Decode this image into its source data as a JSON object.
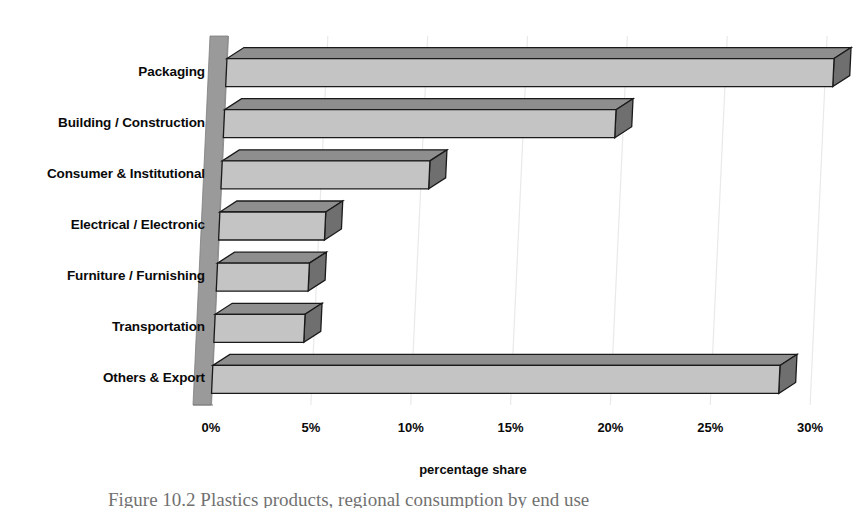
{
  "figure": {
    "caption": "Figure 10.2 Plastics products, regional consumption by end use"
  },
  "chart_data": {
    "type": "bar",
    "orientation": "horizontal",
    "style": "3d-bar",
    "title": "",
    "subtitle": "",
    "xlabel": "percentage share",
    "ylabel": "",
    "categories": [
      "Packaging",
      "Building / Construction",
      "Consumer & Institutional",
      "Electrical / Electronic",
      "Furniture / Furnishing",
      "Transportation",
      "Others & Export"
    ],
    "values": [
      30.4,
      19.6,
      10.4,
      5.3,
      4.6,
      4.5,
      28.4
    ],
    "xlim": [
      0,
      31
    ],
    "xticks": [
      0,
      5,
      10,
      15,
      20,
      25,
      30
    ],
    "xtick_labels": [
      "0%",
      "5%",
      "10%",
      "15%",
      "20%",
      "25%",
      "30%"
    ],
    "grid": "vertical-faint",
    "legend": "none",
    "bar_fill_color": "#c4c4c4",
    "bar_top_color": "#8e8e8e",
    "bar_side_color": "#6f6f6f",
    "bar_edge_color": "#1a1a1a",
    "wall_color": "#9a9a9a",
    "background_color": "#ffffff"
  }
}
